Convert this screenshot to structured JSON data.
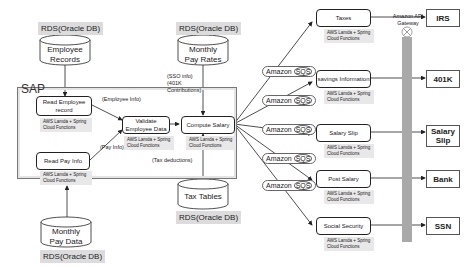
{
  "databases": {
    "employee_records": {
      "label": "RDS(Oracle DB)",
      "name": "Employee Records"
    },
    "monthly_pay_rates": {
      "label": "RDS(Oracle DB)",
      "name": "Monthly Pay Rates"
    },
    "monthly_pay_data": {
      "label": "RDS(Oracle DB)",
      "name": "Monthly Pay Data"
    },
    "tax_tables": {
      "label": "RDS(Oracle DB)",
      "name": "Tax Tables"
    }
  },
  "sap": {
    "title": "SAP",
    "read_employee": {
      "name": "Read Employee record",
      "note": "AWS Lamda + Spring Cloud Functions"
    },
    "read_pay": {
      "name": "Read Pay Info",
      "note": "AWS Lamda + Spring Cloud Functions"
    },
    "validate": {
      "name": "Validate Employee Data",
      "note": "AWS Lamda + Spring Cloud Functions"
    },
    "compute": {
      "name": "Compute Salary",
      "note": "AWS Lamda + Spring Cloud Functions"
    },
    "edge_labels": {
      "employee_info": "(Employee Info)",
      "pay_info": "(Pay Info)",
      "tax_deductions": "(Tax deductions)",
      "sso_info": "(SSO info) (401K Contributions)"
    }
  },
  "queue_label": {
    "prefix": "Amazon ",
    "suffix": "SQS"
  },
  "services": [
    {
      "name": "Taxes",
      "note": "AWS Lamda + Spring Cloud Functions",
      "target": "IRS"
    },
    {
      "name": "savings Information",
      "note": "AWS Lamda + Spring Cloud Functions",
      "target": "401K"
    },
    {
      "name": "Salary Slip",
      "note": "AWS Lamda + Spring Cloud Functions",
      "target": "Salary Slip"
    },
    {
      "name": "Post Salary",
      "note": "AWS Lamda + Spring Cloud Functions",
      "target": "Bank"
    },
    {
      "name": "Social Security",
      "note": "AWS Lamda + Spring Cloud Functions",
      "target": "SSN"
    }
  ],
  "gateway": {
    "label": "Amazon API Gateway"
  },
  "colors": {
    "gateway_bar": "#a9a9a9",
    "note_bg": "#e8e8e8",
    "rds_label_bg": "#dcdcdc"
  }
}
